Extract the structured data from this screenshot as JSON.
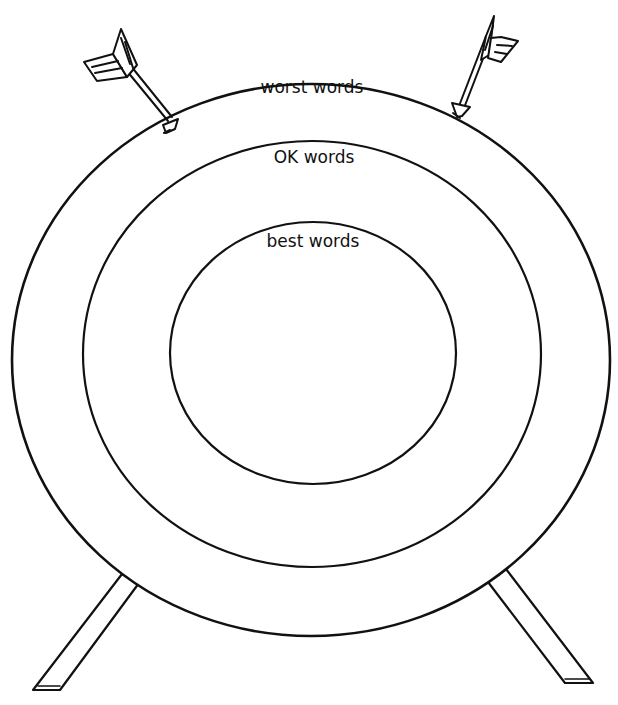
{
  "diagram": {
    "type": "archery-target",
    "rings": [
      {
        "id": "outer",
        "label": "worst words"
      },
      {
        "id": "middle",
        "label": "OK words"
      },
      {
        "id": "inner",
        "label": "best words"
      }
    ],
    "arrows": [
      {
        "id": "left",
        "position": "stuck in outer ring, upper left"
      },
      {
        "id": "right",
        "position": "stuck in outer ring, upper right"
      }
    ],
    "legs": 2,
    "colors": {
      "stroke": "#111111",
      "background": "#ffffff"
    }
  }
}
